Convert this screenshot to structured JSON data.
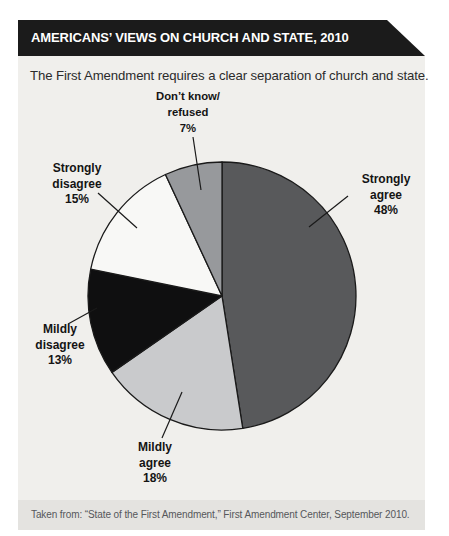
{
  "header": {
    "title": "AMERICANS’ VIEWS ON CHURCH AND STATE, 2010",
    "subtitle": "The First Amendment requires a clear separation of church and state."
  },
  "footer": {
    "source": "Taken from: “State of the First Amendment,” First Amendment Center, September 2010."
  },
  "colors": {
    "banner_bg": "#1b1b1b",
    "panel_bg": "#f0efec",
    "footer_bg": "#e4e3e0",
    "outline": "#1a1a1a"
  },
  "chart_data": {
    "type": "pie",
    "title": "Americans’ views on church and state, 2010",
    "question": "The First Amendment requires a clear separation of church and state.",
    "start_angle_deg": 0,
    "direction": "clockwise",
    "legend_position": "labels-around-pie",
    "slices": [
      {
        "label": "Strongly agree",
        "value_pct": 48,
        "color": "#58595b",
        "label_lines": [
          "Strongly",
          "agree",
          "48%"
        ]
      },
      {
        "label": "Mildly agree",
        "value_pct": 18,
        "color": "#c9cacc",
        "label_lines": [
          "Mildly",
          "agree",
          "18%"
        ]
      },
      {
        "label": "Mildly disagree",
        "value_pct": 13,
        "color": "#0f0f10",
        "label_lines": [
          "Mildly",
          "disagree",
          "13%"
        ]
      },
      {
        "label": "Strongly disagree",
        "value_pct": 15,
        "color": "#f8f8f6",
        "label_lines": [
          "Strongly",
          "disagree",
          "15%"
        ]
      },
      {
        "label": "Don’t know/refused",
        "value_pct": 7,
        "color": "#97999c",
        "label_lines": [
          "Don’t know/",
          "refused",
          "7%"
        ]
      }
    ]
  }
}
